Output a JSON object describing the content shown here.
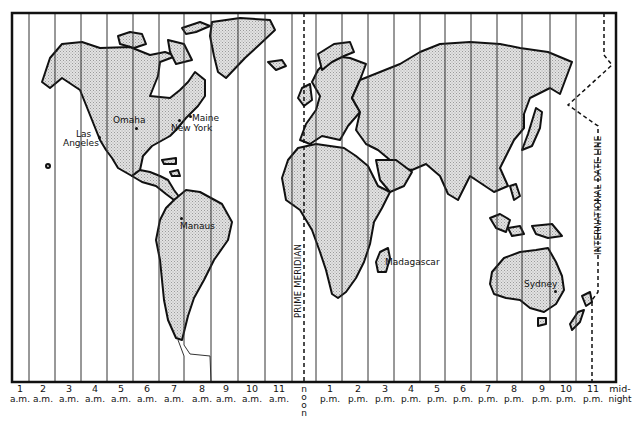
{
  "map": {
    "title": "World Time Zones",
    "reference_lines": {
      "prime_meridian": "PRIME MERIDIAN",
      "date_line": "INTERNATIONAL DATE LINE"
    },
    "cities": [
      {
        "name": "Las",
        "name2": "Angeles"
      },
      {
        "name": "Omaha"
      },
      {
        "name": "Maine"
      },
      {
        "name": "New York"
      },
      {
        "name": "Manaus"
      },
      {
        "name": "Madagascar"
      },
      {
        "name": "Sydney"
      }
    ],
    "time_zones": [
      {
        "num": "1",
        "period": "a.m."
      },
      {
        "num": "2",
        "period": "a.m."
      },
      {
        "num": "3",
        "period": "a.m."
      },
      {
        "num": "4",
        "period": "a.m."
      },
      {
        "num": "5",
        "period": "a.m."
      },
      {
        "num": "6",
        "period": "a.m."
      },
      {
        "num": "7",
        "period": "a.m."
      },
      {
        "num": "8",
        "period": "a.m."
      },
      {
        "num": "9",
        "period": "a.m."
      },
      {
        "num": "10",
        "period": "a.m."
      },
      {
        "num": "11",
        "period": "a.m."
      },
      {
        "num": "noon",
        "period": ""
      },
      {
        "num": "1",
        "period": "p.m."
      },
      {
        "num": "2",
        "period": "p.m."
      },
      {
        "num": "3",
        "period": "p.m."
      },
      {
        "num": "4",
        "period": "p.m."
      },
      {
        "num": "5",
        "period": "p.m."
      },
      {
        "num": "6",
        "period": "p.m."
      },
      {
        "num": "7",
        "period": "p.m."
      },
      {
        "num": "8",
        "period": "p.m."
      },
      {
        "num": "9",
        "period": "p.m."
      },
      {
        "num": "10",
        "period": "p.m."
      },
      {
        "num": "11",
        "period": "p.m."
      },
      {
        "num": "mid-",
        "period": "night"
      }
    ],
    "noon_letters": [
      "n",
      "o",
      "o",
      "n"
    ],
    "colors": {
      "land_fill": "#d4d4d4",
      "outline": "#111111",
      "background": "#ffffff"
    }
  }
}
